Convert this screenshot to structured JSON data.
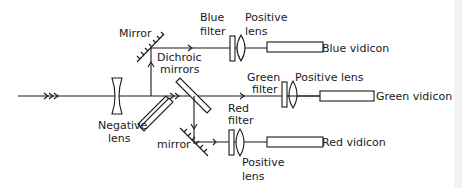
{
  "diagram": {
    "type": "color camera optical layout",
    "labels": {
      "mirror_top": "Mirror",
      "blue_filter_1": "Blue",
      "blue_filter_2": "filter",
      "blue_lens_1": "Positive",
      "blue_lens_2": "lens",
      "blue_vidicon": "Blue vidicon",
      "dichroic_1": "Dichroic",
      "dichroic_2": "mirrors",
      "green_filter_1": "Green",
      "green_filter_2": "filter",
      "green_lens": "Positive lens",
      "green_vidicon": "Green vidicon",
      "negative_lens_1": "Negative",
      "negative_lens_2": "lens",
      "mirror_bottom": "mirror",
      "red_filter_1": "Red",
      "red_filter_2": "filter",
      "red_lens_1": "Positive",
      "red_lens_2": "lens",
      "red_vidicon": "Red vidicon"
    },
    "channels": [
      "Blue",
      "Green",
      "Red"
    ],
    "colors": {
      "ink": "#1a1a1a",
      "background": "#ffffff"
    }
  }
}
